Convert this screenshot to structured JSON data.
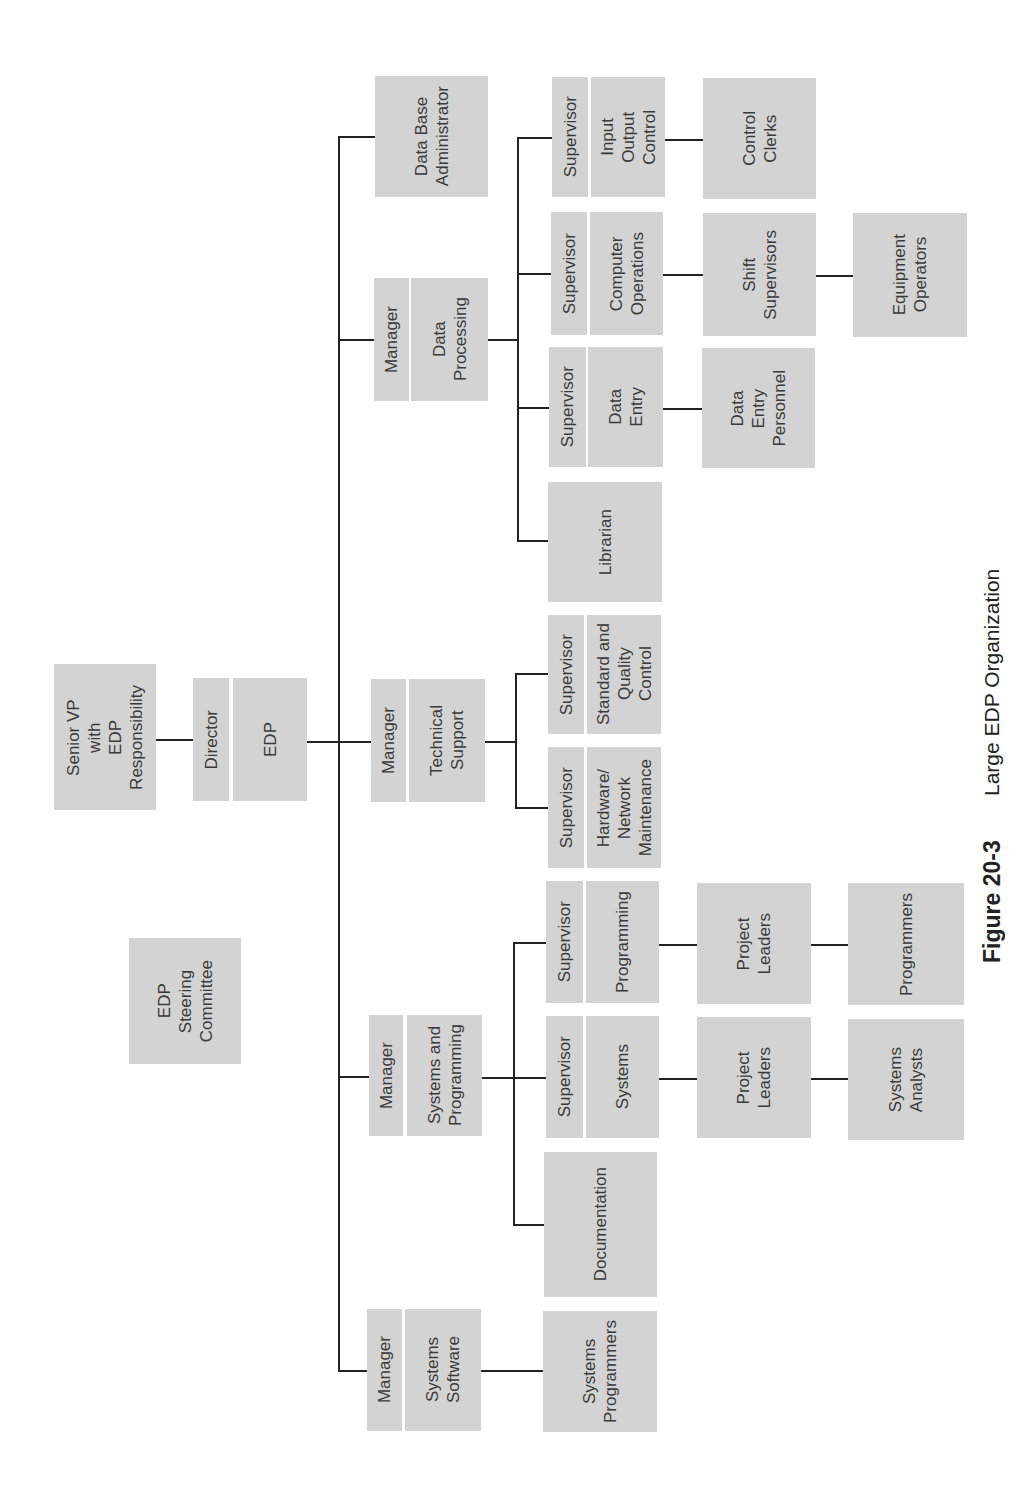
{
  "figure": {
    "label": "Figure 20-3",
    "title": "Large EDP Organization"
  },
  "colors": {
    "box_fill": "#d3d3d3",
    "connector": "#222222",
    "text": "#3a3a3a",
    "background": "#ffffff"
  },
  "org": {
    "steering_committee": "EDP\nSteering\nCommittee",
    "senior_vp": "Senior VP\nwith\nEDP\nResponsibility",
    "director": {
      "role": "Director",
      "unit": "EDP"
    },
    "data_base_administrator": "Data Base\nAdministrator",
    "data_processing": {
      "role": "Manager",
      "unit": "Data\nProcessing",
      "input_output_control": {
        "role": "Supervisor",
        "unit": "Input\nOutput\nControl",
        "reports": [
          "Control\nClerks"
        ]
      },
      "computer_operations": {
        "role": "Supervisor",
        "unit": "Computer\nOperations",
        "reports": [
          "Shift\nSupervisors",
          "Equipment\nOperators"
        ]
      },
      "data_entry": {
        "role": "Supervisor",
        "unit": "Data\nEntry",
        "reports": [
          "Data\nEntry\nPersonnel"
        ]
      },
      "librarian": "Librarian"
    },
    "technical_support": {
      "role": "Manager",
      "unit": "Technical\nSupport",
      "standard_quality_control": {
        "role": "Supervisor",
        "unit": "Standard and\nQuality\nControl"
      },
      "hardware_network_maintenance": {
        "role": "Supervisor",
        "unit": "Hardware/\nNetwork\nMaintenance"
      }
    },
    "systems_and_programming": {
      "role": "Manager",
      "unit": "Systems and\nProgramming",
      "programming": {
        "role": "Supervisor",
        "unit": "Programming",
        "reports": [
          "Project\nLeaders",
          "Programmers"
        ]
      },
      "systems": {
        "role": "Supervisor",
        "unit": "Systems",
        "reports": [
          "Project\nLeaders",
          "Systems\nAnalysts"
        ]
      },
      "documentation": "Documentation"
    },
    "systems_software": {
      "role": "Manager",
      "unit": "Systems\nSoftware",
      "reports": [
        "Systems\nProgrammers"
      ]
    }
  }
}
